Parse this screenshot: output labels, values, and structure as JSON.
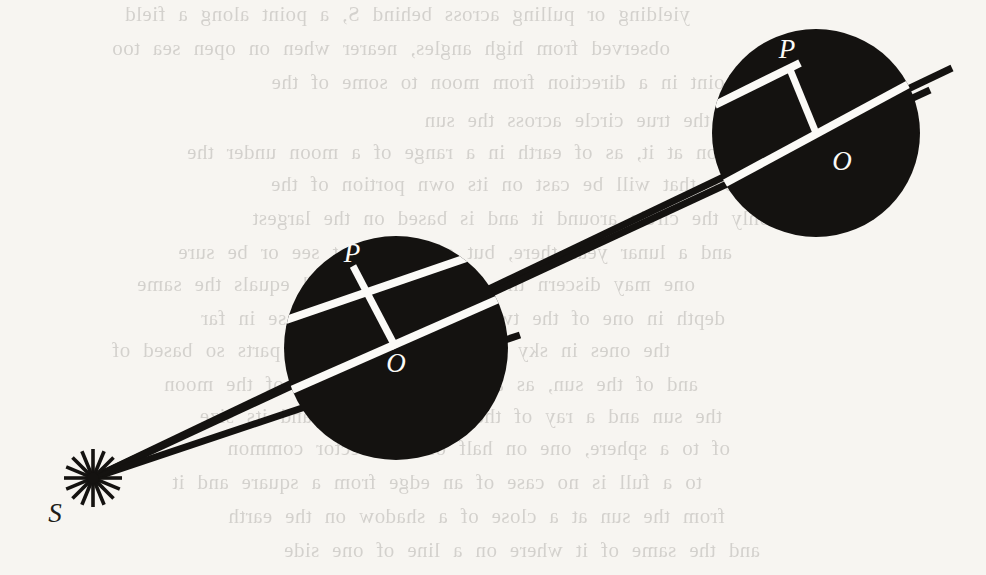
{
  "figure": {
    "kind": "geometric-diagram",
    "caption_visible": false,
    "background_color": "#f7f5f1",
    "ink_color": "#141210",
    "highlight_color": "#fbfaf7",
    "labels": [
      {
        "id": "S",
        "text": "S",
        "x": 55,
        "y": 522,
        "size": 27,
        "color": "#201c18",
        "role": "light-source-label"
      },
      {
        "id": "P-left",
        "text": "P",
        "x": 352,
        "y": 262,
        "size": 27,
        "color": "#fbfaf7",
        "role": "tangency-point-label"
      },
      {
        "id": "O-left",
        "text": "O",
        "x": 396,
        "y": 372,
        "size": 27,
        "color": "#fbfaf7",
        "role": "circle-centre-label"
      },
      {
        "id": "P-right",
        "text": "P",
        "x": 787,
        "y": 58,
        "size": 27,
        "color": "#fbfaf7",
        "role": "tangency-point-label"
      },
      {
        "id": "O-right",
        "text": "O",
        "x": 842,
        "y": 170,
        "size": 27,
        "color": "#fbfaf7",
        "role": "circle-centre-label"
      }
    ],
    "source_point": {
      "name": "S",
      "x": 93,
      "y": 478,
      "burst_spokes": 16,
      "burst_radius": 29,
      "burst_inner_radius": 3
    },
    "circles": [
      {
        "name": "near-disc",
        "cx": 396,
        "cy": 348,
        "r": 112,
        "fill": "#141210"
      },
      {
        "name": "far-disc",
        "cx": 816,
        "cy": 133,
        "r": 104,
        "fill": "#141210"
      }
    ],
    "rays": [
      {
        "name": "upper-tangent-ray",
        "x1": 93,
        "y1": 478,
        "x2": 952,
        "y2": 68,
        "width": 7
      },
      {
        "name": "centre-ray",
        "x1": 93,
        "y1": 478,
        "x2": 930,
        "y2": 90,
        "width": 7
      },
      {
        "name": "lower-tangent-ray",
        "x1": 93,
        "y1": 478,
        "x2": 520,
        "y2": 335,
        "width": 7
      }
    ],
    "chords": [
      {
        "name": "near-disc-tangent-chord",
        "x1": 286,
        "y1": 320,
        "x2": 510,
        "y2": 243,
        "width": 8
      },
      {
        "name": "near-disc-diameter",
        "x1": 287,
        "y1": 392,
        "x2": 512,
        "y2": 293,
        "width": 8
      },
      {
        "name": "near-disc-radius-OP",
        "x1": 396,
        "y1": 348,
        "x2": 353,
        "y2": 266,
        "width": 7
      },
      {
        "name": "far-disc-tangent-chord",
        "x1": 715,
        "y1": 105,
        "x2": 800,
        "y2": 63,
        "width": 8
      },
      {
        "name": "far-disc-diameter",
        "x1": 716,
        "y1": 188,
        "x2": 920,
        "y2": 78,
        "width": 8
      },
      {
        "name": "far-disc-radius-OP",
        "x1": 816,
        "y1": 133,
        "x2": 789,
        "y2": 67,
        "width": 7
      }
    ],
    "bleed_text": {
      "note": "faint show-through text from the reverse side of the page, mirrored",
      "lines": [
        {
          "text": "yielding or pulling across behind S, a point along a field",
          "x": 170,
          "y": 2
        },
        {
          "text": "observed from high angles, nearer when on open sea too",
          "x": 150,
          "y": 36
        },
        {
          "text": "the point in a direction from moon to some of the",
          "x": 255,
          "y": 70
        },
        {
          "text": "depend on the true circle across the sun",
          "x": 300,
          "y": 108
        },
        {
          "text": "moon at it, as of earth in a range of a moon under the",
          "x": 225,
          "y": 140
        },
        {
          "text": "shadow that will be cast on its own portion of the",
          "x": 255,
          "y": 172
        },
        {
          "text": "only the circle around it and is based on the largest",
          "x": 250,
          "y": 206
        },
        {
          "text": "and a lunar year there, but one may not see or be sure",
          "x": 212,
          "y": 240
        },
        {
          "text": "one may discern the ring when full and equals the same",
          "x": 175,
          "y": 272
        },
        {
          "text": "depth in one of the two, and also of the case in far",
          "x": 205,
          "y": 306
        },
        {
          "text": "the ones in sky for the same of some parts so based of",
          "x": 150,
          "y": 338
        },
        {
          "text": "and of the sun, as a shadow of the ring of the moon",
          "x": 178,
          "y": 372
        },
        {
          "text": "the sun and a ray of the angle in small and its size",
          "x": 202,
          "y": 404
        },
        {
          "text": "of to a sphere, one on half of one vector common",
          "x": 210,
          "y": 436
        },
        {
          "text": "to a full is no case of an edge from a square and it",
          "x": 182,
          "y": 470
        },
        {
          "text": "from the sun at a close of a shadow on the earth",
          "x": 205,
          "y": 504
        },
        {
          "text": "and the same of it where on a line of one side",
          "x": 240,
          "y": 538
        }
      ]
    }
  }
}
